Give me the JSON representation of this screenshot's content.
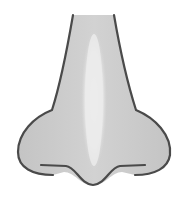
{
  "illustration": {
    "subject": "nose",
    "colors": {
      "background": "#ffffff",
      "fill": "#c9c9c9",
      "outline": "#4a4a4a",
      "highlight": "#ececec"
    }
  }
}
